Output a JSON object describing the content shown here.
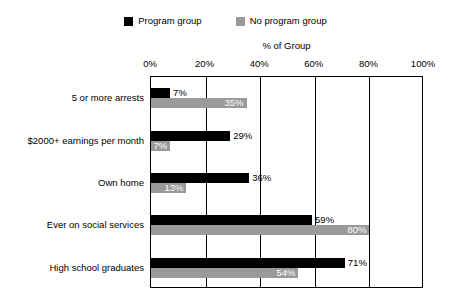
{
  "legend": {
    "entries": [
      {
        "label": "Program group",
        "color": "#000000",
        "swatch_name": "legend-swatch-program"
      },
      {
        "label": "No program group",
        "color": "#9a9a9a",
        "swatch_name": "legend-swatch-no-program"
      }
    ]
  },
  "axis": {
    "title": "% of Group",
    "ticks": [
      "0%",
      "20%",
      "40%",
      "60%",
      "80%",
      "100%"
    ]
  },
  "chart_data": {
    "type": "bar",
    "orientation": "horizontal",
    "title": "",
    "xlabel": "% of Group",
    "ylabel": "",
    "xlim": [
      0,
      100
    ],
    "xticks": [
      0,
      20,
      40,
      60,
      80,
      100
    ],
    "xtick_labels": [
      "0%",
      "20%",
      "40%",
      "60%",
      "80%",
      "100%"
    ],
    "grid": true,
    "grid_axis": "x",
    "legend_position": "top-center",
    "categories": [
      "5 or more arrests",
      "$2000+ earnings per month",
      "Own home",
      "Ever on social services",
      "High school graduates"
    ],
    "series": [
      {
        "name": "Program group",
        "color": "#000000",
        "values": [
          7,
          29,
          36,
          59,
          71
        ],
        "labels": [
          "7%",
          "29%",
          "36%",
          "59%",
          "71%"
        ],
        "label_placement": "outside-right"
      },
      {
        "name": "No program group",
        "color": "#9a9a9a",
        "values": [
          35,
          7,
          13,
          80,
          54
        ],
        "labels": [
          "35%",
          "7%",
          "13%",
          "80%",
          "54%"
        ],
        "label_placement": "inside-right"
      }
    ]
  }
}
